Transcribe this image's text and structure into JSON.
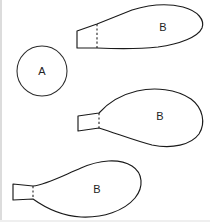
{
  "figure": {
    "background_color": "#ffffff",
    "stroke_color": "#1a1a1a",
    "label_color": "#232323",
    "border_color": "#dcdcdc",
    "width": 210,
    "height": 222,
    "labels": {
      "circle": "A",
      "balloon_top": "B",
      "balloon_middle": "B",
      "balloon_bottom": "B"
    },
    "shapes": [
      {
        "id": "circle-a",
        "name": "circle",
        "label": "A",
        "center_x": 42,
        "center_y": 71,
        "radius": 25,
        "label_x": 42,
        "label_y": 72
      },
      {
        "id": "balloon-top",
        "name": "teardrop-balloon",
        "label": "B",
        "orientation": "horizontal-flat-top",
        "tail_side": "left",
        "tail_x": 77,
        "dashed_divider_x": 97,
        "label_x": 163,
        "label_y": 28
      },
      {
        "id": "balloon-middle",
        "name": "teardrop-balloon",
        "label": "B",
        "orientation": "horizontal-rounded",
        "tail_side": "left",
        "tail_x": 78,
        "dashed_divider_x": 99,
        "label_x": 160,
        "label_y": 117
      },
      {
        "id": "balloon-bottom",
        "name": "teardrop-balloon",
        "label": "B",
        "orientation": "tilted",
        "tail_side": "left",
        "tail_x": 13,
        "dashed_divider_x": 33,
        "label_x": 97,
        "label_y": 190
      }
    ]
  }
}
